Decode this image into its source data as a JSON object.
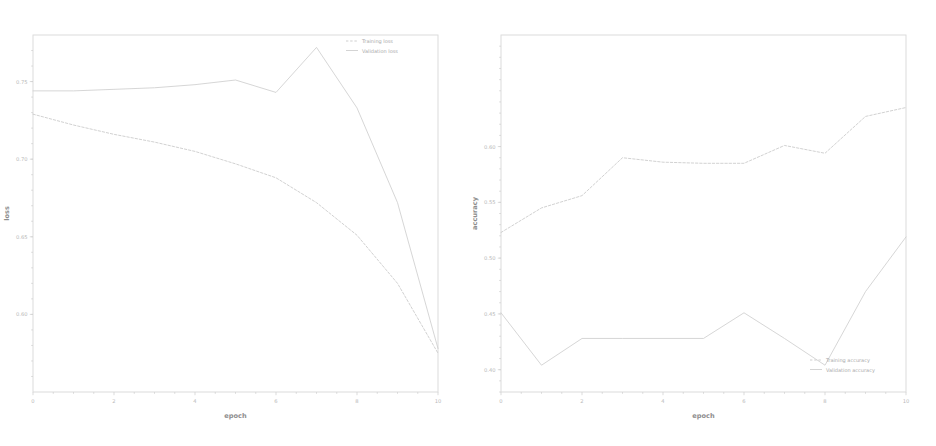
{
  "figure": {
    "background": "#ffffff",
    "ink_color": "#c9c9c9",
    "spine_color": "#d8d8d8",
    "tick_label_color": "#b9b9b9"
  },
  "chart_data": [
    {
      "type": "line",
      "title": "",
      "xlabel": "epoch",
      "ylabel": "loss",
      "x": [
        0,
        1,
        2,
        3,
        4,
        5,
        6,
        7,
        8,
        9,
        10
      ],
      "xlim": [
        0,
        10
      ],
      "ylim": [
        0.55,
        0.78
      ],
      "xticks": [
        0,
        2,
        4,
        6,
        8,
        10
      ],
      "xticklabels": [
        "0",
        "2",
        "4",
        "6",
        "8",
        "10"
      ],
      "yticks": [
        0.6,
        0.65,
        0.7,
        0.75
      ],
      "yticklabels": [
        "0.60",
        "0.65",
        "0.70",
        "0.75"
      ],
      "grid": false,
      "legend_position": "upper right",
      "series": [
        {
          "name": "Training loss",
          "color": "#c9c9c9",
          "linestyle": "dashed",
          "values": [
            0.729,
            0.722,
            0.716,
            0.711,
            0.705,
            0.697,
            0.688,
            0.672,
            0.651,
            0.62,
            0.575
          ]
        },
        {
          "name": "Validation loss",
          "color": "#cfcfcf",
          "linestyle": "solid",
          "values": [
            0.744,
            0.744,
            0.745,
            0.746,
            0.748,
            0.751,
            0.743,
            0.772,
            0.733,
            0.672,
            0.578
          ]
        }
      ]
    },
    {
      "type": "line",
      "title": "",
      "xlabel": "epoch",
      "ylabel": "accuracy",
      "x": [
        0,
        1,
        2,
        3,
        4,
        5,
        6,
        7,
        8,
        9,
        10
      ],
      "xlim": [
        0,
        10
      ],
      "ylim": [
        0.38,
        0.7
      ],
      "xticks": [
        0,
        2,
        4,
        6,
        8,
        10
      ],
      "xticklabels": [
        "0",
        "2",
        "4",
        "6",
        "8",
        "10"
      ],
      "yticks": [
        0.4,
        0.45,
        0.5,
        0.55,
        0.6
      ],
      "yticklabels": [
        "0.40",
        "0.45",
        "0.50",
        "0.55",
        "0.60"
      ],
      "grid": false,
      "legend_position": "lower right",
      "series": [
        {
          "name": "Training accuracy",
          "color": "#c9c9c9",
          "linestyle": "dashed",
          "values": [
            0.523,
            0.545,
            0.556,
            0.59,
            0.586,
            0.585,
            0.585,
            0.601,
            0.594,
            0.627,
            0.635
          ]
        },
        {
          "name": "Validation accuracy",
          "color": "#cfcfcf",
          "linestyle": "solid",
          "values": [
            0.451,
            0.404,
            0.428,
            0.428,
            0.428,
            0.428,
            0.451,
            0.428,
            0.404,
            0.47,
            0.519
          ]
        }
      ]
    }
  ]
}
